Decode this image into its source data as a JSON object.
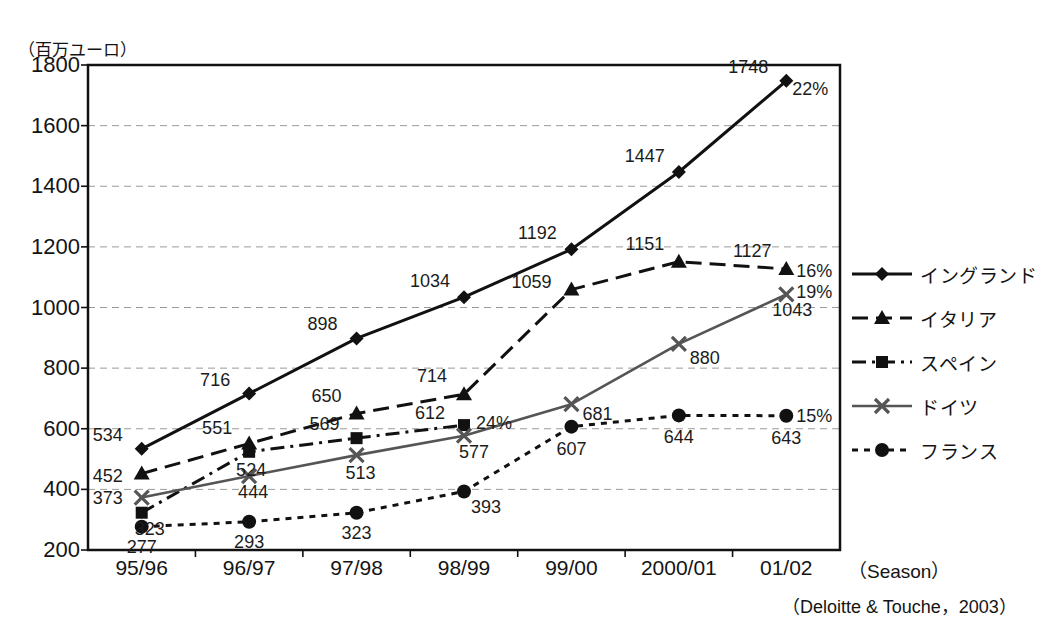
{
  "chart_data": {
    "type": "line",
    "title": "",
    "unit_label": "（百万ユーロ）",
    "xlabel": "（Season）",
    "ylabel": "",
    "source": "（Deloitte & Touche，2003）",
    "categories": [
      "95/96",
      "96/97",
      "97/98",
      "98/99",
      "99/00",
      "2000/01",
      "01/02"
    ],
    "ylim": [
      200,
      1800
    ],
    "ytick_values": [
      "200",
      "400",
      "600",
      "800",
      "1000",
      "1200",
      "1400",
      "1600",
      "1800"
    ],
    "ystep": 200,
    "grid": true,
    "legend_position": "right",
    "series": [
      {
        "name": "イングランド",
        "marker": "diamond",
        "line_style": "solid",
        "color": "#111111",
        "values": [
          534,
          716,
          898,
          1034,
          1192,
          1447,
          1748
        ],
        "labels": [
          "534",
          "716",
          "898",
          "1034",
          "1192",
          "1447",
          "1748"
        ],
        "end_pct": "22%"
      },
      {
        "name": "イタリア",
        "marker": "triangle",
        "line_style": "dashed",
        "color": "#111111",
        "values": [
          452,
          551,
          650,
          714,
          1059,
          1151,
          1127
        ],
        "labels": [
          "452",
          "551",
          "650",
          "714",
          "1059",
          "1151",
          "1127"
        ],
        "end_pct": "16%"
      },
      {
        "name": "スペイン",
        "marker": "square",
        "line_style": "dash-dot",
        "color": "#111111",
        "values": [
          323,
          524,
          569,
          612,
          null,
          null,
          null
        ],
        "labels": [
          "323",
          "524",
          "569",
          "612",
          "",
          "",
          ""
        ],
        "end_pct": "24%"
      },
      {
        "name": "ドイツ",
        "marker": "cross",
        "line_style": "solid",
        "color": "#555555",
        "values": [
          373,
          444,
          513,
          577,
          681,
          880,
          1043
        ],
        "labels": [
          "373",
          "444",
          "513",
          "577",
          "681",
          "880",
          "1043"
        ],
        "end_pct": "19%"
      },
      {
        "name": "フランス",
        "marker": "circle",
        "line_style": "dotted",
        "color": "#111111",
        "values": [
          277,
          293,
          323,
          393,
          607,
          644,
          643
        ],
        "labels": [
          "277",
          "293",
          "323",
          "393",
          "607",
          "644",
          "643"
        ],
        "end_pct": "15%"
      }
    ],
    "annotations": [
      {
        "text": "22%",
        "series": "イングランド",
        "at_category": "01/02"
      },
      {
        "text": "16%",
        "series": "イタリア",
        "at_category": "01/02"
      },
      {
        "text": "19%",
        "series": "ドイツ",
        "at_category": "01/02"
      },
      {
        "text": "15%",
        "series": "フランス",
        "at_category": "01/02"
      },
      {
        "text": "24%",
        "series": "スペイン",
        "at_category": "98/99"
      }
    ]
  },
  "legend": {
    "items": [
      {
        "label": "イングランド"
      },
      {
        "label": "イタリア"
      },
      {
        "label": "スペイン"
      },
      {
        "label": "ドイツ"
      },
      {
        "label": "フランス"
      }
    ]
  }
}
